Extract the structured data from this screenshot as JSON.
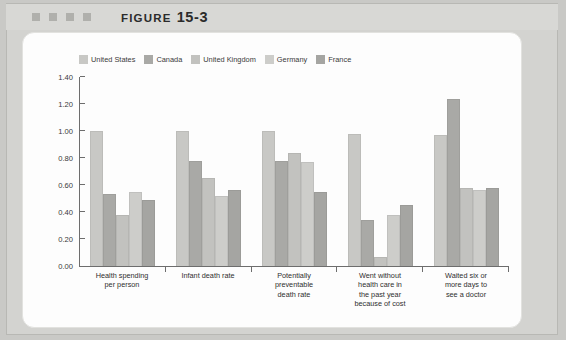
{
  "header": {
    "figure_label": "FIGURE",
    "figure_number": "15-3",
    "decor_dot_count": 4
  },
  "chart_data": {
    "type": "bar",
    "title": "",
    "xlabel": "",
    "ylabel": "",
    "ylim": [
      0.0,
      1.4
    ],
    "yticks": [
      "0.00",
      "0.20",
      "0.40",
      "0.60",
      "0.80",
      "1.00",
      "1.20",
      "1.40"
    ],
    "ytick_values": [
      0.0,
      0.2,
      0.4,
      0.6,
      0.8,
      1.0,
      1.2,
      1.4
    ],
    "grid": false,
    "legend_position": "top-left",
    "categories": [
      "Health spending per person",
      "Infant death rate",
      "Potentially preventable death rate",
      "Went without health care in the past year because of cost",
      "Waited six or more days to see a doctor"
    ],
    "category_lines": [
      [
        "Health spending",
        "per person"
      ],
      [
        "Infant death rate"
      ],
      [
        "Potentially",
        "preventable",
        "death rate"
      ],
      [
        "Went without",
        "health care in",
        "the past year",
        "because of cost"
      ],
      [
        "Waited six or",
        "more days to",
        "see a doctor"
      ]
    ],
    "series": [
      {
        "name": "United States",
        "color": "#c8c8c5",
        "values": [
          1.0,
          1.0,
          1.0,
          0.98,
          0.97
        ]
      },
      {
        "name": "Canada",
        "color": "#a9a9a6",
        "values": [
          0.53,
          0.78,
          0.78,
          0.34,
          1.24
        ]
      },
      {
        "name": "United Kingdom",
        "color": "#c2c2bf",
        "values": [
          0.38,
          0.65,
          0.84,
          0.07,
          0.58
        ]
      },
      {
        "name": "Germany",
        "color": "#cdcdca",
        "values": [
          0.55,
          0.52,
          0.77,
          0.38,
          0.56
        ]
      },
      {
        "name": "France",
        "color": "#a5a5a2",
        "values": [
          0.49,
          0.56,
          0.55,
          0.45,
          0.58
        ]
      }
    ]
  },
  "colors": {
    "frame": "#d3d3d0",
    "card": "#fdfdfd",
    "axis": "#6d6d6d",
    "text": "#2f2f2f"
  }
}
